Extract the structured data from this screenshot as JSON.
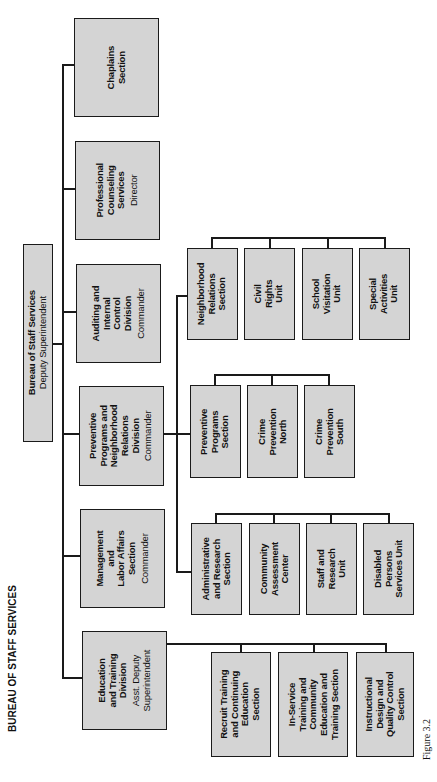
{
  "page_title": "BUREAU OF STAFF SERVICES",
  "figure_label": "Figure 3.2",
  "colors": {
    "box_fill": "#d4d4d4",
    "line": "#1a1a1a"
  },
  "root": {
    "name": [
      "Bureau of Staff Services"
    ],
    "title": "Deputy Superintendent"
  },
  "divisions": [
    {
      "name": [
        "Chaplains",
        "Section"
      ],
      "title": ""
    },
    {
      "name": [
        "Professional",
        "Counseling",
        "Services"
      ],
      "title": "Director"
    },
    {
      "name": [
        "Auditing and",
        "Internal",
        "Control",
        "Division"
      ],
      "title": "Commander"
    },
    {
      "name": [
        "Preventive",
        "Programs and",
        "Neighborhood",
        "Relations",
        "Division"
      ],
      "title": "Commander"
    },
    {
      "name": [
        "Management",
        "and",
        "Labor Affairs",
        "Section"
      ],
      "title": "Commander"
    },
    {
      "name": [
        "Education",
        "and Training",
        "Division"
      ],
      "title": "Asst. Deputy Superintendent"
    }
  ],
  "preventive_groups": {
    "neighborhood": [
      [
        "Neighborhood",
        "Relations",
        "Section"
      ],
      [
        "Civil",
        "Rights",
        "Unit"
      ],
      [
        "School",
        "Visitation",
        "Unit"
      ],
      [
        "Special",
        "Activities",
        "Unit"
      ]
    ],
    "preventive": [
      [
        "Preventive",
        "Programs",
        "Section"
      ],
      [
        "Crime",
        "Prevention",
        "North"
      ],
      [
        "Crime",
        "Prevention",
        "South"
      ]
    ],
    "administrative": [
      [
        "Administrative",
        "and Research",
        "Section"
      ],
      [
        "Community",
        "Assessment",
        "Center"
      ],
      [
        "Staff and",
        "Research",
        "Unit"
      ],
      [
        "Disabled",
        "Persons",
        "Services Unit"
      ]
    ]
  },
  "education_units": [
    [
      "Recruit Training",
      "and Continuing",
      "Education",
      "Section"
    ],
    [
      "In-Service",
      "Training and",
      "Community",
      "Education and",
      "Training Section"
    ],
    [
      "Instructional",
      "Design and",
      "Quality Control",
      "Section"
    ]
  ]
}
